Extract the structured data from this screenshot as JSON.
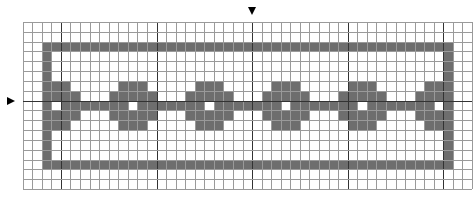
{
  "pattern": {
    "cols": 47,
    "rows": 17,
    "cell_width": 9.56,
    "cell_height": 9.83,
    "thick_every": 10,
    "thick_col_offset": 4,
    "thick_row_offset": 8,
    "colors": {
      "fill": "#6e6e6e",
      "grid_line": "#9a9a9a",
      "thick_line": "#333333",
      "background": "#ffffff",
      "marker": "#000000"
    },
    "frame": {
      "top_row": 2,
      "bottom_row": 14,
      "left_col": 2,
      "right_col": 44
    },
    "center_bar_row": 8,
    "motif_centers": [
      3,
      11,
      19,
      27,
      35,
      43
    ],
    "motif_rows": [
      {
        "row_offset": -2,
        "half_width": 1
      },
      {
        "row_offset": -1,
        "half_width": 2
      },
      {
        "row_offset": 0,
        "half_width": 2,
        "hole_center": true
      },
      {
        "row_offset": 1,
        "half_width": 2
      },
      {
        "row_offset": 2,
        "half_width": 1
      }
    ]
  },
  "markers": {
    "top": {
      "col_line": 24,
      "label": "center-column-marker"
    },
    "left": {
      "row_line": 8,
      "label": "center-row-marker"
    }
  }
}
